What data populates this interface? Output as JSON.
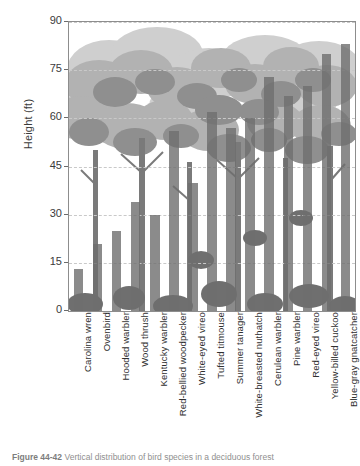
{
  "figure": {
    "caption_prefix": "Figure 44-42",
    "caption_text": "Vertical distribution of bird species in a deciduous forest"
  },
  "axes": {
    "ylabel": "Height (ft)",
    "yticks": [
      0,
      15,
      30,
      45,
      60,
      75,
      90
    ],
    "ylim": [
      0,
      90
    ],
    "grid": "horizontal-dashed",
    "xlabel": ""
  },
  "colors": {
    "bar": "#6e6e6e",
    "axis": "#8d8d8d",
    "grid": "#c9c9c9",
    "text": "#3b3b3b",
    "canopy_light": "#c8c8c8",
    "canopy_mid": "#a8a8a8",
    "canopy_dark": "#8a8a8a",
    "trunk": "#7c7c7c"
  },
  "chart_data": {
    "type": "bar",
    "title": "",
    "xlabel": "",
    "ylabel": "Height (ft)",
    "ylim": [
      0,
      90
    ],
    "yticks": [
      0,
      15,
      30,
      45,
      60,
      75,
      90
    ],
    "grid": true,
    "legend": "none",
    "categories": [
      "Carolina wren",
      "Ovenbird",
      "Hooded warbler",
      "Wood thrush",
      "Kentucky warbler",
      "Red-bellied woodpecker",
      "White-eyed vireo",
      "Tufted titmouse",
      "Summer tanager",
      "White-breasted nuthatch",
      "Cerulean warbler",
      "Pine warbler",
      "Red-eyed vireo",
      "Yellow-billed cuckoo",
      "Blue-gray gnatcatcher"
    ],
    "values": [
      13,
      21,
      25,
      34,
      30,
      56,
      40,
      62,
      57,
      60,
      73,
      67,
      70,
      80,
      83
    ]
  }
}
